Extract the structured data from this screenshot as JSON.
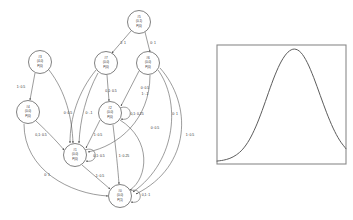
{
  "diagram": {
    "nodes": [
      {
        "id": "node-5",
        "label_id": "#5",
        "coords": "(0,1)",
        "prob": "P(0)",
        "cx": 139,
        "cy": 22,
        "r": 11.5
      },
      {
        "id": "node-3",
        "label_id": "#3",
        "coords": "(4,0)",
        "prob": "P(0)",
        "cx": 40,
        "cy": 62,
        "r": 11.5
      },
      {
        "id": "node-7",
        "label_id": "#7",
        "coords": "(0,0)",
        "prob": "P(0)",
        "cx": 106,
        "cy": 63,
        "r": 11.5
      },
      {
        "id": "node-6",
        "label_id": "#6",
        "coords": "(0,0)",
        "prob": "P(0)",
        "cx": 148,
        "cy": 63,
        "r": 11.5
      },
      {
        "id": "node-4",
        "label_id": "#4",
        "coords": "(0,0)",
        "prob": "P(0)",
        "cx": 28,
        "cy": 112,
        "r": 11.5
      },
      {
        "id": "node-2",
        "label_id": "#2",
        "coords": "(0,0)",
        "prob": "P(0)",
        "cx": 110,
        "cy": 113,
        "r": 11.5
      },
      {
        "id": "node-1",
        "label_id": "#1",
        "coords": "(0,0)",
        "prob": "P(0)",
        "cx": 75,
        "cy": 155,
        "r": 11.5
      },
      {
        "id": "node-0",
        "label_id": "#0",
        "coords": "(0,0)",
        "prob": "P(1)",
        "cx": 120,
        "cy": 196,
        "r": 11.5
      }
    ],
    "edges": [
      {
        "name": "edge-5-to-7",
        "label": "1: 1",
        "lx": 123,
        "ly": 44
      },
      {
        "name": "edge-5-to-6",
        "label": "0: 1",
        "lx": 153,
        "ly": 44
      },
      {
        "name": "edge-3-to-4",
        "label": "1: 0.5",
        "lx": 21,
        "ly": 88
      },
      {
        "name": "edge-3-to-1",
        "label": "0: 0.5",
        "lx": 68,
        "ly": 114
      },
      {
        "name": "edge-7-to-2",
        "label": "0,1: 0.5",
        "lx": 111,
        "ly": 92
      },
      {
        "name": "edge-7-to-1",
        "label": "0: -1",
        "lx": 89,
        "ly": 114
      },
      {
        "name": "edge-6-to-2",
        "label": "0: 0.5",
        "lx": 145,
        "ly": 89
      },
      {
        "name": "edge-6-to-2b",
        "label": "1: -1",
        "lx": 145,
        "ly": 95
      },
      {
        "name": "edge-6-to-0",
        "label": "0: 1",
        "lx": 175,
        "ly": 115
      },
      {
        "name": "edge-6-to-0b",
        "label": "1: 0.5",
        "lx": 190,
        "ly": 136
      },
      {
        "name": "edge-2-self",
        "label": "0,1: 0.25",
        "lx": 137,
        "ly": 115
      },
      {
        "name": "edge-2-to-1",
        "label": "1: 0.5",
        "lx": 98,
        "ly": 136
      },
      {
        "name": "edge-2-to-0",
        "label": "1: 0.25",
        "lx": 124,
        "ly": 157
      },
      {
        "name": "edge-2-to-0b",
        "label": "0: 0.5",
        "lx": 155,
        "ly": 129
      },
      {
        "name": "edge-4-to-1",
        "label": "0,1: 0.5",
        "lx": 41,
        "ly": 136
      },
      {
        "name": "edge-4-to-0",
        "label": "0: 1",
        "lx": 47,
        "ly": 176
      },
      {
        "name": "edge-1-self",
        "label": "0,1: 0.5",
        "lx": 99,
        "ly": 157
      },
      {
        "name": "edge-1-to-0",
        "label": "1: 0.5",
        "lx": 100,
        "ly": 177
      },
      {
        "name": "edge-0-self",
        "label": "0,1: 1",
        "lx": 146,
        "ly": 196
      }
    ]
  },
  "chart_data": {
    "type": "line",
    "title": "",
    "xlabel": "",
    "ylabel": "",
    "x": [
      0,
      0.05,
      0.1,
      0.15,
      0.2,
      0.25,
      0.3,
      0.35,
      0.4,
      0.45,
      0.5,
      0.55,
      0.6,
      0.65,
      0.7,
      0.75,
      0.8,
      0.85,
      0.9,
      0.95,
      1.0
    ],
    "values": [
      0.008,
      0.016,
      0.032,
      0.062,
      0.112,
      0.192,
      0.305,
      0.447,
      0.606,
      0.757,
      0.878,
      0.955,
      0.982,
      0.952,
      0.864,
      0.733,
      0.58,
      0.428,
      0.295,
      0.19,
      0.115
    ],
    "xlim": [
      0,
      1
    ],
    "ylim": [
      0,
      1
    ],
    "grid": false,
    "legend": null,
    "peak_x": 0.6,
    "peak_y": 0.982,
    "series": [
      {
        "name": "bell-curve",
        "values": [
          0.008,
          0.016,
          0.032,
          0.062,
          0.112,
          0.192,
          0.305,
          0.447,
          0.606,
          0.757,
          0.878,
          0.955,
          0.982,
          0.952,
          0.864,
          0.733,
          0.58,
          0.428,
          0.295,
          0.19,
          0.115
        ]
      }
    ]
  },
  "colors": {
    "background": "#ffffff",
    "edge": "#4a4a4a",
    "node_stroke": "#3d3d3d",
    "text": "#2b2b2b",
    "chart_frame": "#8a8a8a",
    "curve": "#5c5c5c"
  }
}
